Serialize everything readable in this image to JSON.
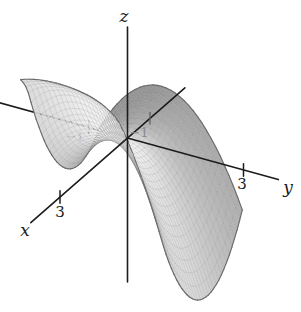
{
  "chart_data": {
    "type": "surface",
    "title": "",
    "axes": {
      "x_label": "x",
      "y_label": "y",
      "z_label": "z"
    },
    "ticks": {
      "x": [
        {
          "value": 3,
          "label": "3",
          "behind_surface": false
        },
        {
          "value": -1,
          "label": "−1",
          "behind_surface": false
        }
      ],
      "y": [
        {
          "value": 3,
          "label": "3",
          "behind_surface": false
        },
        {
          "value": -1,
          "label": "−1",
          "behind_surface": true
        }
      ]
    },
    "surface": {
      "function_estimate": "z ≈ x² − y² (saddle through the origin)",
      "x_range": [
        -1.15,
        2.35
      ],
      "y_range": [
        -1.4,
        2.3
      ],
      "mesh_divisions": [
        30,
        32
      ]
    },
    "view": {
      "origin_px": [
        127.5,
        138
      ],
      "x_unit_px": [
        -22.5,
        19.67
      ],
      "y_unit_px": [
        38.67,
        10.67
      ],
      "z_unit_px": 23,
      "x_axis_extent": [
        -2.55,
        4.3
      ],
      "y_axis_extent": [
        -3.35,
        3.9
      ],
      "z_axis_span_px": [
        27,
        282
      ]
    },
    "colors": {
      "background": "#ffffff",
      "axis": "#1c1c1c",
      "outline": "#6b6b6b",
      "grid_line": "rgba(80,80,80,0.2)",
      "surface_min_grey": 140,
      "surface_max_grey": 245,
      "surface_opacity": 0.91,
      "muted_tick_label": "#8b8b8b",
      "hidden_tick_label": "#3a3a3a"
    }
  }
}
